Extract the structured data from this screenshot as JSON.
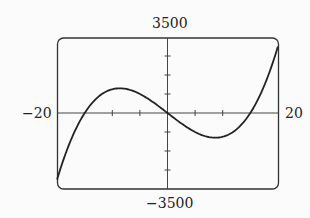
{
  "chart_data": {
    "type": "line",
    "title": "",
    "function": "f(x) = x^3 - 225x",
    "xlabel": "",
    "ylabel": "",
    "xlim": [
      -20,
      20
    ],
    "ylim": [
      -3500,
      3500
    ],
    "tick_labels": {
      "x_min": "−20",
      "x_max": "20",
      "y_max": "3500",
      "y_min": "−3500"
    },
    "x_ticks_step": 5,
    "y_ticks_step": 1000,
    "grid": false,
    "series": [
      {
        "name": "curve",
        "x": [
          -20,
          -15,
          -8.66,
          0,
          8.66,
          15,
          20
        ],
        "y": [
          -3500,
          0,
          1299,
          0,
          -1299,
          0,
          3500
        ]
      }
    ]
  }
}
